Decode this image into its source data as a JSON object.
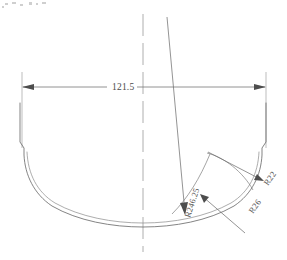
{
  "drawing": {
    "title": "Hull cross-section technical drawing",
    "background_color": "#ffffff",
    "line_color": "#6e6e6e",
    "text_color": "#4a4a4a",
    "width": 287,
    "height": 260
  },
  "dimensions": [
    {
      "id": "width-dimension",
      "label": "121.5",
      "orientation": "horizontal",
      "arrow_style": "both-ends-filled",
      "x1": 22,
      "x2": 266,
      "y": 87
    }
  ],
  "radii": [
    {
      "id": "radius-bottom",
      "label": "R246.25",
      "rotation": -72,
      "text_x": 190,
      "text_y": 218
    },
    {
      "id": "radius-bilge",
      "label": "R26",
      "rotation": -55,
      "text_x": 253,
      "text_y": 214
    },
    {
      "id": "radius-chine",
      "label": "R22",
      "rotation": -55,
      "text_x": 268,
      "text_y": 186
    }
  ],
  "centerline": {
    "id": "vertical-centerline",
    "label": "centerline",
    "x": 143,
    "y1": 14,
    "y2": 252,
    "dash": "22 7"
  },
  "annotations": {
    "speck_color": "#cfcfcf"
  }
}
